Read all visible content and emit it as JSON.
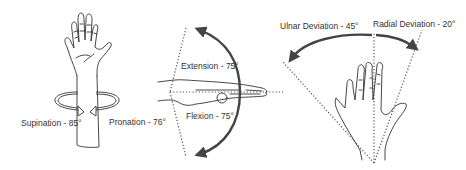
{
  "diagram": {
    "panels": [
      {
        "id": "forearm-rotation",
        "labels": {
          "supination": "Supination - 85°",
          "pronation": "Pronation - 76°"
        }
      },
      {
        "id": "wrist-flexion-extension",
        "labels": {
          "extension": "Extension - 75°",
          "flexion": "Flexion - 75°"
        }
      },
      {
        "id": "wrist-deviation",
        "labels": {
          "ulnar": "Ulnar Deviation - 45°",
          "radial": "Radial Deviation - 20°"
        }
      }
    ],
    "colors": {
      "line": "#333333",
      "arrow": "#444444",
      "text": "#333333",
      "background": "#ffffff"
    }
  }
}
